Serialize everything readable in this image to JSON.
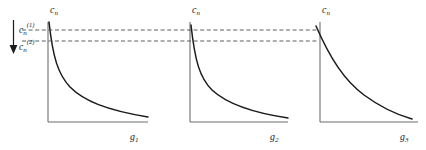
{
  "figure": {
    "kind": "line-plot-triptych",
    "background_color": "#ffffff",
    "axis_color": "#6e6e6e",
    "curve_color": "#1a1a1a",
    "dash_color": "#4d4d4d",
    "arrow_color": "#1a1a1a"
  },
  "annotation": {
    "arrow_name": "downward-arrow",
    "upper_label_base": "c",
    "upper_label_sub": "n",
    "upper_label_sup": "(1)",
    "lower_label_base": "c",
    "lower_label_sub": "n",
    "lower_label_sup": "(2)"
  },
  "panels": [
    {
      "id": "panel-1",
      "y_axis_label_base": "c",
      "y_axis_label_sub": "n",
      "x_axis_label_base": "g",
      "x_axis_label_sub": "1"
    },
    {
      "id": "panel-2",
      "y_axis_label_base": "c",
      "y_axis_label_sub": "n",
      "x_axis_label_base": "g",
      "x_axis_label_sub": "2"
    },
    {
      "id": "panel-3",
      "y_axis_label_base": "c",
      "y_axis_label_sub": "n",
      "x_axis_label_base": "g",
      "x_axis_label_sub": "3"
    }
  ],
  "chart_data": {
    "type": "line",
    "title": "",
    "subtitle": "",
    "xlabel": "",
    "ylabel": "",
    "grid": false,
    "legend_position": "none",
    "annotations": [
      {
        "name": "level-line-upper",
        "type": "horizontal-dashed-line",
        "label": "c_n^(1)",
        "y_value": 0.9,
        "spans_panels": [
          1,
          2,
          3
        ]
      },
      {
        "name": "level-line-lower",
        "type": "horizontal-dashed-line",
        "label": "c_n^(2)",
        "y_value": 0.78,
        "spans_panels": [
          1,
          2,
          3
        ]
      },
      {
        "name": "decrease-arrow",
        "type": "arrow",
        "direction": "down",
        "from_label": "c_n^(1)",
        "to_label": "c_n^(2)"
      }
    ],
    "panels": [
      {
        "name": "panel-1",
        "xlabel": "g_1",
        "ylabel": "c_n",
        "xlim": [
          0,
          1
        ],
        "ylim": [
          0,
          1
        ],
        "series": [
          {
            "name": "c_n vs g_1",
            "shape": "steep-hyperbolic-decay",
            "x": [
              0.0,
              0.02,
              0.05,
              0.09,
              0.14,
              0.2,
              0.28,
              0.38,
              0.5,
              0.65,
              0.82,
              1.0
            ],
            "y": [
              1.0,
              0.86,
              0.68,
              0.54,
              0.44,
              0.36,
              0.29,
              0.23,
              0.18,
              0.14,
              0.11,
              0.09
            ]
          }
        ]
      },
      {
        "name": "panel-2",
        "xlabel": "g_2",
        "ylabel": "c_n",
        "xlim": [
          0,
          1
        ],
        "ylim": [
          0,
          1
        ],
        "series": [
          {
            "name": "c_n vs g_2",
            "shape": "steep-hyperbolic-decay",
            "x": [
              0.0,
              0.02,
              0.05,
              0.09,
              0.14,
              0.2,
              0.28,
              0.38,
              0.5,
              0.65,
              0.82,
              1.0
            ],
            "y": [
              1.0,
              0.84,
              0.66,
              0.52,
              0.42,
              0.34,
              0.27,
              0.21,
              0.16,
              0.12,
              0.09,
              0.07
            ]
          }
        ]
      },
      {
        "name": "panel-3",
        "xlabel": "g_3",
        "ylabel": "c_n",
        "xlim": [
          0,
          1
        ],
        "ylim": [
          0,
          1
        ],
        "series": [
          {
            "name": "c_n vs g_3",
            "shape": "gentle-convex-decay",
            "x": [
              0.0,
              0.08,
              0.17,
              0.26,
              0.36,
              0.46,
              0.56,
              0.66,
              0.76,
              0.86,
              0.94,
              1.0
            ],
            "y": [
              0.93,
              0.84,
              0.75,
              0.66,
              0.57,
              0.48,
              0.39,
              0.31,
              0.23,
              0.16,
              0.11,
              0.08
            ]
          }
        ]
      }
    ]
  }
}
